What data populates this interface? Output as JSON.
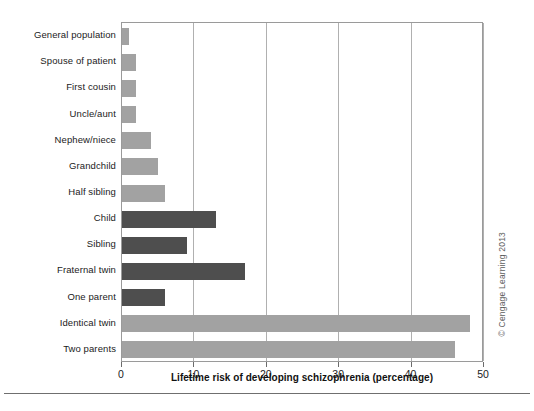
{
  "chart_data": {
    "type": "bar",
    "orientation": "horizontal",
    "title": "",
    "xlabel": "Lifetime risk of developing schizophrenia (percentage)",
    "ylabel": "",
    "xlim": [
      0,
      50
    ],
    "xticks": [
      0,
      10,
      20,
      30,
      40,
      50
    ],
    "xtick_labels": [
      "0",
      "10",
      "20",
      "30",
      "40",
      "50"
    ],
    "grid": "vertical gridlines at each x tick",
    "legend": "none",
    "categories": [
      "General population",
      "Spouse of patient",
      "First cousin",
      "Uncle/aunt",
      "Nephew/niece",
      "Grandchild",
      "Half sibling",
      "Child",
      "Sibling",
      "Fraternal twin",
      "One parent",
      "Identical twin",
      "Two parents"
    ],
    "values": [
      1,
      2,
      2,
      2,
      4,
      5,
      6,
      13,
      9,
      17,
      6,
      48,
      46
    ],
    "bar_colors": [
      "light",
      "light",
      "light",
      "light",
      "light",
      "light",
      "light",
      "dark",
      "dark",
      "dark",
      "dark",
      "light",
      "light"
    ],
    "colors": {
      "light": "#a2a2a2",
      "dark": "#4e4e4e",
      "axis": "#9a9a9a",
      "gridline": "#b0b0b0",
      "text": "#1b1b1b",
      "background": "#ffffff"
    }
  },
  "credit": "© Cengage Learning 2013"
}
